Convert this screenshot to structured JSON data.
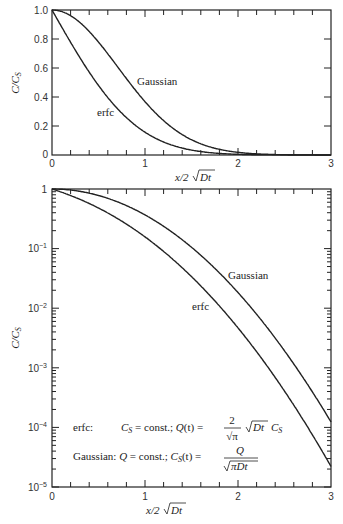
{
  "chart_data": [
    {
      "type": "line",
      "title": "",
      "xlabel": "x/2√(Dt)",
      "ylabel": "C/C_S",
      "xlim": [
        0,
        3
      ],
      "ylim": [
        0,
        1.0
      ],
      "yscale": "linear",
      "xticks": [
        "0",
        "1",
        "2",
        "3"
      ],
      "yticks": [
        "0",
        "0.2",
        "0.4",
        "0.6",
        "0.8",
        "1.0"
      ],
      "grid": false,
      "x": [
        0,
        0.25,
        0.5,
        0.75,
        1.0,
        1.25,
        1.5,
        1.75,
        2.0,
        2.25,
        2.5,
        2.75,
        3.0
      ],
      "series": [
        {
          "name": "erfc",
          "values": [
            1.0,
            0.724,
            0.48,
            0.289,
            0.157,
            0.077,
            0.034,
            0.013,
            0.005,
            0.0015,
            0.0004,
            0.0001,
            2e-05
          ]
        },
        {
          "name": "Gaussian",
          "values": [
            1.0,
            0.939,
            0.779,
            0.57,
            0.368,
            0.21,
            0.105,
            0.047,
            0.018,
            0.006,
            0.002,
            0.0005,
            0.0001
          ]
        }
      ],
      "annotations": [
        "Gaussian",
        "erfc"
      ]
    },
    {
      "type": "line",
      "title": "",
      "xlabel": "x/2√(Dt)",
      "ylabel": "C/C_S",
      "xlim": [
        0,
        3
      ],
      "ylim": [
        1e-05,
        1
      ],
      "yscale": "log",
      "xticks": [
        "0",
        "1",
        "2",
        "3"
      ],
      "yticks": [
        "10^-5",
        "10^-4",
        "10^-3",
        "10^-2",
        "10^-1",
        "1"
      ],
      "grid": false,
      "x": [
        0,
        0.25,
        0.5,
        0.75,
        1.0,
        1.25,
        1.5,
        1.75,
        2.0,
        2.25,
        2.5,
        2.75,
        3.0
      ],
      "series": [
        {
          "name": "erfc",
          "values": [
            1.0,
            0.724,
            0.48,
            0.289,
            0.157,
            0.077,
            0.034,
            0.013,
            0.0047,
            0.0015,
            0.00041,
            0.0001,
            2.2e-05
          ]
        },
        {
          "name": "Gaussian",
          "values": [
            1.0,
            0.939,
            0.779,
            0.57,
            0.368,
            0.21,
            0.105,
            0.047,
            0.0183,
            0.0063,
            0.0019,
            0.00052,
            0.000123
          ]
        }
      ],
      "annotations": [
        "Gaussian",
        "erfc",
        "erfc:  C_S = const.;  Q(t) = (2/√π) √(Dt) C_S",
        "Gaussian: Q = const.;  C_S(t) = Q/√(πDt)"
      ]
    }
  ],
  "top": {
    "ylabel": "C/C",
    "ylabel_sub": "S",
    "xlabel_pre": "x/2",
    "xlabel_rad": "Dt",
    "xticks": [
      "0",
      "1",
      "2",
      "3"
    ],
    "yticks": [
      "0",
      "0.2",
      "0.4",
      "0.6",
      "0.8",
      "1.0"
    ],
    "label_gaussian": "Gaussian",
    "label_erfc": "erfc"
  },
  "bottom": {
    "ylabel": "C/C",
    "ylabel_sub": "S",
    "xlabel_pre": "x/2",
    "xlabel_rad": "Dt",
    "xticks": [
      "0",
      "1",
      "2",
      "3"
    ],
    "yticks_base": [
      "1",
      "10",
      "10",
      "10",
      "10",
      "10"
    ],
    "yticks_exp": [
      "",
      "−1",
      "−2",
      "−3",
      "−4",
      "−5"
    ],
    "label_gaussian": "Gaussian",
    "label_erfc": "erfc",
    "eq1_name": "erfc:",
    "eq1_a": "C",
    "eq1_a_sub": "S",
    "eq1_b": " = const.;  ",
    "eq1_c": "Q",
    "eq1_d": "(t) = ",
    "eq1_frac_num": "2",
    "eq1_frac_den": "√π",
    "eq1_rad": "Dt",
    "eq1_e": "C",
    "eq1_e_sub": "S",
    "eq2_name": "Gaussian:",
    "eq2_a": "Q",
    "eq2_b": " = const.;  ",
    "eq2_c": "C",
    "eq2_c_sub": "S",
    "eq2_d": "(t) = ",
    "eq2_frac_num": "Q",
    "eq2_frac_den": "πDt"
  },
  "caption_fragment": "2.11   The diffusion ..."
}
